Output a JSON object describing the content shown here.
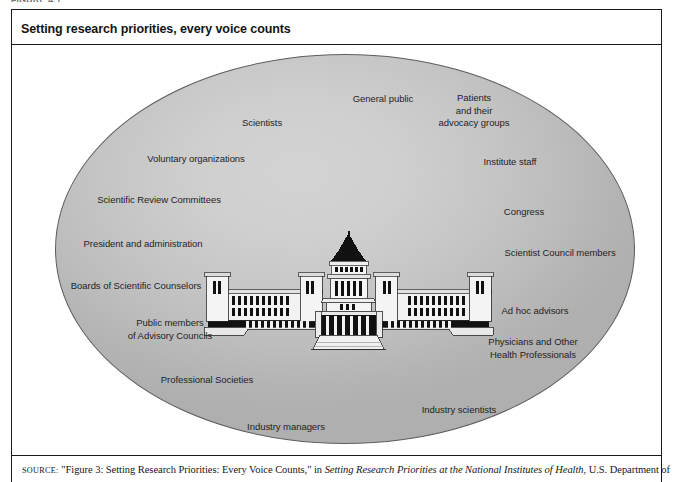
{
  "figure": {
    "top_label": "FIGURE 4.1",
    "title": "Setting research priorities, every voice counts"
  },
  "diagram": {
    "type": "venn-style-ellipse-with-central-illustration",
    "center_illustration": "national-diet-building",
    "ellipse_fill": "#c8c8c8",
    "ellipse_border": "#5d5d5d",
    "stakeholders": [
      {
        "id": "general-public",
        "text": "General public",
        "x": 371,
        "y": 94,
        "align": "center"
      },
      {
        "id": "patients",
        "text": "Patients\nand their\nadvocacy groups",
        "x": 462,
        "y": 99,
        "align": "center"
      },
      {
        "id": "scientists",
        "text": "Scientists",
        "x": 250,
        "y": 119,
        "align": "center"
      },
      {
        "id": "voluntary-organizations",
        "text": "Voluntary organizations",
        "x": 184,
        "y": 155,
        "align": "center"
      },
      {
        "id": "institute-staff",
        "text": "Institute staff",
        "x": 498,
        "y": 158,
        "align": "center"
      },
      {
        "id": "scientific-review-committees",
        "text": "Scientific Review Committees",
        "x": 147,
        "y": 196,
        "align": "center"
      },
      {
        "id": "congress",
        "text": "Congress",
        "x": 512,
        "y": 208,
        "align": "center"
      },
      {
        "id": "president-and-administration",
        "text": "President and administration",
        "x": 131,
        "y": 240,
        "align": "center"
      },
      {
        "id": "scientist-council-members",
        "text": "Scientist Council members",
        "x": 548,
        "y": 249,
        "align": "center"
      },
      {
        "id": "boards-of-scientific-counselors",
        "text": "Boards of Scientific Counselors",
        "x": 124,
        "y": 282,
        "align": "center"
      },
      {
        "id": "ad-hoc-advisors",
        "text": "Ad hoc advisors",
        "x": 523,
        "y": 307,
        "align": "center"
      },
      {
        "id": "public-members-advisory-councils",
        "text": "Public members\nof Advisory Councils",
        "x": 158,
        "y": 325,
        "align": "center"
      },
      {
        "id": "physicians-and-other-health-professionals",
        "text": "Physicians and Other\nHealth Professionals",
        "x": 521,
        "y": 344,
        "align": "center"
      },
      {
        "id": "professional-societies",
        "text": "Professional Societies",
        "x": 195,
        "y": 376,
        "align": "center"
      },
      {
        "id": "industry-scientists",
        "text": "Industry scientists",
        "x": 447,
        "y": 406,
        "align": "center"
      },
      {
        "id": "industry-managers",
        "text": "Industry managers",
        "x": 274,
        "y": 423,
        "align": "center"
      }
    ]
  },
  "source": {
    "prefix": "SOURCE:",
    "quoted": "\"Figure 3: Setting Research Priorities: Every Voice Counts,\" in",
    "italic_title": "Setting Research Priorities at the National Institutes of Health,",
    "trailing": "U.S. Department of"
  }
}
